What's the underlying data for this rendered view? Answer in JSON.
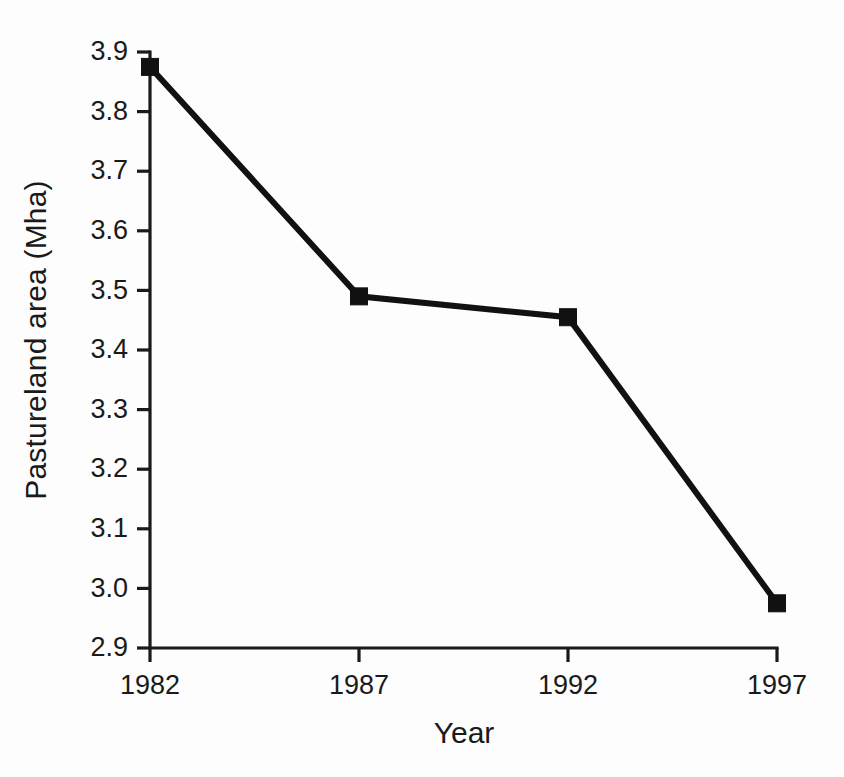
{
  "chart_data": {
    "type": "line",
    "title": "",
    "subtitle": "",
    "xlabel": "Year",
    "ylabel": "Pastureland area (Mha)",
    "categories": [
      "1982",
      "1987",
      "1992",
      "1997"
    ],
    "x": [
      1982,
      1987,
      1992,
      1997
    ],
    "values": [
      3.875,
      3.49,
      3.455,
      2.975
    ],
    "series": [
      {
        "name": "Pastureland area",
        "values": [
          3.875,
          3.49,
          3.455,
          2.975
        ],
        "marker": "filled-square",
        "color": "#111111"
      }
    ],
    "xlim": [
      1982,
      1997
    ],
    "ylim": [
      2.9,
      3.9
    ],
    "ytick_labels": [
      "3.9",
      "3.8",
      "3.7",
      "3.6",
      "3.5",
      "3.4",
      "3.3",
      "3.2",
      "3.1",
      "3.0",
      "2.9"
    ],
    "ytick_values": [
      3.9,
      3.8,
      3.7,
      3.6,
      3.5,
      3.4,
      3.3,
      3.2,
      3.1,
      3.0,
      2.9
    ],
    "xtick_labels": [
      "1982",
      "1987",
      "1992",
      "1997"
    ],
    "xtick_values": [
      1982,
      1987,
      1992,
      1997
    ],
    "grid": false,
    "legend": false,
    "legend_position": "none",
    "annotations": [],
    "colors": {
      "line": "#111111",
      "marker": "#111111",
      "axis": "#1a1a1a",
      "text": "#1a1a1a",
      "background": "#fdfdfd"
    }
  },
  "axis": {
    "x_title": "Year",
    "y_title": "Pastureland area (Mha)"
  }
}
